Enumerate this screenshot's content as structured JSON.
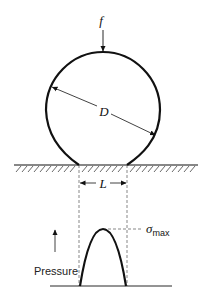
{
  "labels": {
    "force": "f",
    "diameter": "D",
    "contact_width": "L",
    "pressure": "Pressure",
    "sigma": "σ",
    "sigma_sub": "max"
  },
  "colors": {
    "stroke": "#111111",
    "hatch": "#444444",
    "dashed": "#555555"
  }
}
